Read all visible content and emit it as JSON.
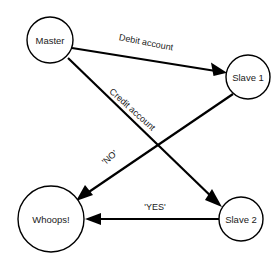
{
  "diagram": {
    "type": "directed-graph",
    "colors": {
      "background": "#ffffff",
      "stroke": "#000000",
      "text": "#1a1a1a"
    },
    "nodes": [
      {
        "id": "master",
        "label": "Master",
        "cx": 50,
        "cy": 40,
        "r": 23
      },
      {
        "id": "slave1",
        "label": "Slave 1",
        "cx": 248,
        "cy": 77,
        "r": 22
      },
      {
        "id": "slave2",
        "label": "Slave 2",
        "cx": 241,
        "cy": 219,
        "r": 22
      },
      {
        "id": "whoops",
        "label": "Whoops!",
        "cx": 51,
        "cy": 219,
        "r": 33
      }
    ],
    "edges": [
      {
        "id": "master-to-slave1",
        "from": "master",
        "to": "slave1",
        "label": "Debit account",
        "label_x": 146,
        "label_y": 43,
        "label_rotation": 11,
        "arrow": "to"
      },
      {
        "id": "master-to-slave2",
        "from": "master",
        "to": "slave2",
        "label": "Credit account",
        "label_x": 132,
        "label_y": 110,
        "label_rotation": 42,
        "arrow": "to"
      },
      {
        "id": "slave1-to-whoops",
        "from": "slave1",
        "to": "whoops",
        "label": "'NO'",
        "label_x": 110,
        "label_y": 158,
        "label_rotation": -41,
        "arrow": "to"
      },
      {
        "id": "slave2-to-whoops",
        "from": "slave2",
        "to": "whoops",
        "label": "'YES'",
        "label_x": 155,
        "label_y": 208,
        "label_rotation": 0,
        "arrow": "to"
      }
    ]
  }
}
